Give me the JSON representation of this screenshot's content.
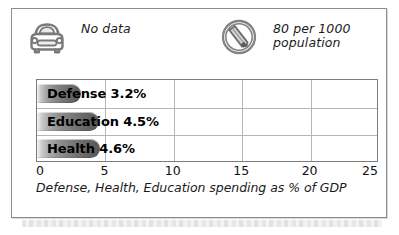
{
  "panel": {
    "background_color": "#ffffff",
    "border_color": "#8d8d8d"
  },
  "stats": [
    {
      "icon": "car-icon",
      "label": "No data"
    },
    {
      "icon": "telephone-icon",
      "label": "80 per 1000\npopulation"
    }
  ],
  "chart_data": {
    "type": "bar",
    "orientation": "horizontal",
    "title": "",
    "caption": "Defense, Health, Education spending as % of GDP",
    "xlabel": "",
    "ylabel": "",
    "categories": [
      "Defense",
      "Education",
      "Health"
    ],
    "values": [
      3.2,
      4.5,
      4.6
    ],
    "value_labels": [
      "3.2%",
      "4.5%",
      "4.6%"
    ],
    "bar_labels": [
      "Defense 3.2%",
      "Education 4.5%",
      "Health 4.6%"
    ],
    "xlim": [
      0,
      25
    ],
    "xticks": [
      0,
      5,
      10,
      15,
      20,
      25
    ],
    "xtick_labels": [
      "0",
      "5",
      "10",
      "15",
      "20",
      "25"
    ],
    "grid": true,
    "gridlines_x": [
      5,
      10,
      15,
      20
    ],
    "legend": null,
    "bar_color_start": "#f4f4f4",
    "bar_color_end": "#575757",
    "plot_border_color": "#7c7c7c",
    "gridline_color": "#b6b6b6"
  }
}
